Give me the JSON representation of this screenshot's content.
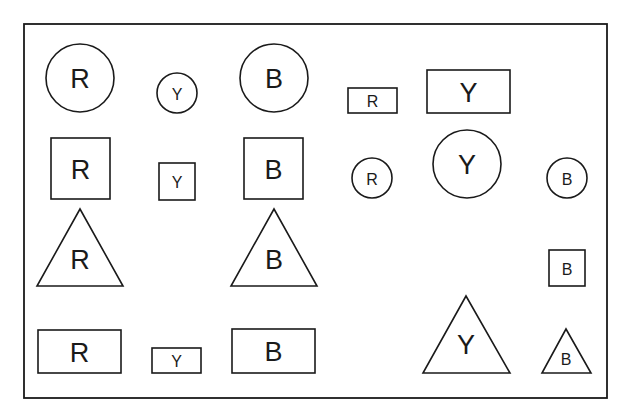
{
  "figure": {
    "frame": {
      "x": 24,
      "y": 24,
      "width": 583,
      "height": 374
    },
    "shapes": [
      {
        "id": "circle-r-large",
        "type": "circle",
        "label": "R",
        "cx": 80,
        "cy": 78,
        "r": 34,
        "font_size": 27
      },
      {
        "id": "circle-y-small",
        "type": "circle",
        "label": "Y",
        "cx": 177,
        "cy": 93,
        "r": 20,
        "font_size": 16
      },
      {
        "id": "circle-b-large",
        "type": "circle",
        "label": "B",
        "cx": 274,
        "cy": 78,
        "r": 34,
        "font_size": 27
      },
      {
        "id": "rect-r-small",
        "type": "rect",
        "label": "R",
        "x": 348,
        "y": 88,
        "w": 49,
        "h": 25,
        "font_size": 16
      },
      {
        "id": "rect-y-large",
        "type": "rect",
        "label": "Y",
        "x": 427,
        "y": 70,
        "w": 83,
        "h": 43,
        "font_size": 27
      },
      {
        "id": "square-r-large",
        "type": "rect",
        "label": "R",
        "x": 51,
        "y": 138,
        "w": 59,
        "h": 61,
        "font_size": 27
      },
      {
        "id": "square-y-small",
        "type": "rect",
        "label": "Y",
        "x": 159,
        "y": 163,
        "w": 36,
        "h": 37,
        "font_size": 16
      },
      {
        "id": "square-b-large",
        "type": "rect",
        "label": "B",
        "x": 244,
        "y": 138,
        "w": 59,
        "h": 61,
        "font_size": 27
      },
      {
        "id": "circle-r-small",
        "type": "circle",
        "label": "R",
        "cx": 372,
        "cy": 178,
        "r": 20,
        "font_size": 16
      },
      {
        "id": "circle-y-large",
        "type": "circle",
        "label": "Y",
        "cx": 467,
        "cy": 164,
        "r": 34,
        "font_size": 27
      },
      {
        "id": "circle-b-small",
        "type": "circle",
        "label": "B",
        "cx": 567,
        "cy": 178,
        "r": 20,
        "font_size": 16
      },
      {
        "id": "triangle-r-large",
        "type": "triangle",
        "label": "R",
        "points": "80,209 37,286 123,286",
        "tx": 80,
        "ty": 259,
        "font_size": 27
      },
      {
        "id": "triangle-b-large",
        "type": "triangle",
        "label": "B",
        "points": "274,209 231,286 317,286",
        "tx": 274,
        "ty": 259,
        "font_size": 27
      },
      {
        "id": "square-b-small",
        "type": "rect",
        "label": "B",
        "x": 549,
        "y": 250,
        "w": 36,
        "h": 36,
        "font_size": 16
      },
      {
        "id": "rect-r-large",
        "type": "rect",
        "label": "R",
        "x": 38,
        "y": 330,
        "w": 83,
        "h": 43,
        "font_size": 27
      },
      {
        "id": "rect-y-small",
        "type": "rect",
        "label": "Y",
        "x": 152,
        "y": 348,
        "w": 49,
        "h": 25,
        "font_size": 16
      },
      {
        "id": "rect-b-large",
        "type": "rect",
        "label": "B",
        "x": 232,
        "y": 329,
        "w": 83,
        "h": 44,
        "font_size": 27
      },
      {
        "id": "triangle-y-large",
        "type": "triangle",
        "label": "Y",
        "points": "466,296 423,373 510,373",
        "tx": 466,
        "ty": 344,
        "font_size": 27
      },
      {
        "id": "triangle-b-small",
        "type": "triangle",
        "label": "B",
        "points": "566,329 542,373 591,373",
        "tx": 566,
        "ty": 358,
        "font_size": 16
      }
    ]
  }
}
